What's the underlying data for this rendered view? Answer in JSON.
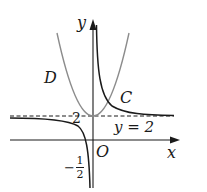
{
  "diagram": {
    "axes": {
      "x_label": "x",
      "y_label": "y",
      "origin_label": "O"
    },
    "asymptote": {
      "label": "y = 2",
      "tick_label": "2",
      "style": "dashed"
    },
    "curves": [
      {
        "name": "D",
        "label": "D",
        "type": "parabola",
        "color": "#8c8c8c"
      },
      {
        "name": "C",
        "label": "C",
        "type": "hyperbola",
        "color": "#1a1a1a"
      }
    ],
    "x_intercept": {
      "sign": "−",
      "numerator": "1",
      "denominator": "2"
    },
    "colors": {
      "axis": "#1a1a1a",
      "curve_C": "#1a1a1a",
      "curve_D": "#8c8c8c",
      "asymptote": "#1a1a1a"
    }
  }
}
